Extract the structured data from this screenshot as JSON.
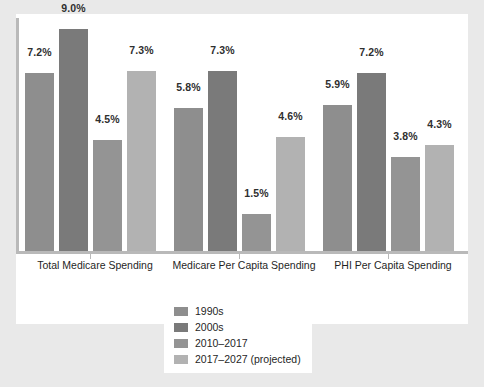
{
  "chart_data": {
    "type": "bar",
    "title": "",
    "subtitle": "",
    "xlabel": "",
    "ylabel": "",
    "grid": false,
    "legend_position": "bottom",
    "ylim": [
      0,
      9.6
    ],
    "value_suffix": "%",
    "categories": [
      "Total Medicare Spending",
      "Medicare Per Capita Spending",
      "PHI Per Capita Spending"
    ],
    "series": [
      {
        "name": "1990s",
        "color": "#8e8e8e",
        "values": [
          7.2,
          5.8,
          5.9
        ],
        "labels": [
          "7.2%",
          "5.8%",
          "5.9%"
        ]
      },
      {
        "name": "2000s",
        "color": "#7a7a7a",
        "values": [
          9.0,
          7.3,
          7.2
        ],
        "labels": [
          "9.0%",
          "7.3%",
          "7.2%"
        ]
      },
      {
        "name": "2010–2017",
        "color": "#949494",
        "values": [
          4.5,
          1.5,
          3.8
        ],
        "labels": [
          "4.5%",
          "1.5%",
          "3.8%"
        ]
      },
      {
        "name": "2017–2027 (projected)",
        "color": "#b2b2b2",
        "values": [
          7.3,
          4.6,
          4.3
        ],
        "labels": [
          "7.3%",
          "4.6%",
          "4.3%"
        ]
      }
    ]
  },
  "legend": {
    "items": [
      {
        "label": "1990s",
        "color": "#8e8e8e"
      },
      {
        "label": "2000s",
        "color": "#7a7a7a"
      },
      {
        "label": "2010–2017",
        "color": "#949494"
      },
      {
        "label": "2017–2027 (projected)",
        "color": "#b2b2b2"
      }
    ]
  },
  "axis": {
    "line_color": "#b9b9b9"
  },
  "figure": {
    "background": "#e9e9e9",
    "panel_background": "#ffffff"
  }
}
